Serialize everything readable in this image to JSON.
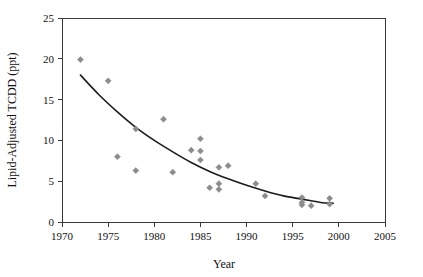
{
  "chart_data": {
    "type": "scatter",
    "title": "",
    "subtitle": "",
    "xlabel": "Year",
    "ylabel": "Lipid-Adjusted TCDD (ppt)",
    "xlim": [
      1970,
      2005
    ],
    "ylim": [
      0,
      25
    ],
    "xticks": [
      1970,
      1975,
      1980,
      1985,
      1990,
      1995,
      2000,
      2005
    ],
    "yticks": [
      0,
      5,
      10,
      15,
      20,
      25
    ],
    "xtick_labels": [
      "1970",
      "1975",
      "1980",
      "1985",
      "1990",
      "1995",
      "2000",
      "2005"
    ],
    "ytick_labels": [
      "0",
      "5",
      "10",
      "15",
      "20",
      "25"
    ],
    "grid": false,
    "legend": false,
    "legend_position": "none",
    "marker_shape": "diamond",
    "marker_color": "#8c8c8c",
    "curve_color": "#1c1c1c",
    "frame": "box",
    "points": [
      {
        "x": 1972.0,
        "y": 19.9
      },
      {
        "x": 1975.0,
        "y": 17.3
      },
      {
        "x": 1976.0,
        "y": 8.0
      },
      {
        "x": 1978.0,
        "y": 11.4
      },
      {
        "x": 1978.0,
        "y": 6.3
      },
      {
        "x": 1981.0,
        "y": 12.6
      },
      {
        "x": 1982.0,
        "y": 6.1
      },
      {
        "x": 1984.0,
        "y": 8.8
      },
      {
        "x": 1985.0,
        "y": 10.2
      },
      {
        "x": 1985.0,
        "y": 8.7
      },
      {
        "x": 1985.0,
        "y": 7.6
      },
      {
        "x": 1986.0,
        "y": 4.2
      },
      {
        "x": 1987.0,
        "y": 6.7
      },
      {
        "x": 1987.0,
        "y": 4.7
      },
      {
        "x": 1987.0,
        "y": 4.0
      },
      {
        "x": 1988.0,
        "y": 6.9
      },
      {
        "x": 1991.0,
        "y": 4.7
      },
      {
        "x": 1992.0,
        "y": 3.2
      },
      {
        "x": 1996.0,
        "y": 3.0
      },
      {
        "x": 1996.0,
        "y": 2.4
      },
      {
        "x": 1996.0,
        "y": 2.1
      },
      {
        "x": 1997.0,
        "y": 2.0
      },
      {
        "x": 1999.0,
        "y": 2.9
      },
      {
        "x": 1999.0,
        "y": 2.2
      }
    ],
    "fit_curve": {
      "description": "exponential decay trend line",
      "x_start": 1972.0,
      "x_end": 1999.4,
      "points": [
        {
          "x": 1972.0,
          "y": 18.0
        },
        {
          "x": 1974.0,
          "y": 15.6
        },
        {
          "x": 1976.0,
          "y": 13.5
        },
        {
          "x": 1978.0,
          "y": 11.6
        },
        {
          "x": 1980.0,
          "y": 10.0
        },
        {
          "x": 1982.0,
          "y": 8.6
        },
        {
          "x": 1984.0,
          "y": 7.3
        },
        {
          "x": 1986.0,
          "y": 6.2
        },
        {
          "x": 1988.0,
          "y": 5.3
        },
        {
          "x": 1990.0,
          "y": 4.5
        },
        {
          "x": 1992.0,
          "y": 3.8
        },
        {
          "x": 1994.0,
          "y": 3.2
        },
        {
          "x": 1996.0,
          "y": 2.8
        },
        {
          "x": 1998.0,
          "y": 2.4
        },
        {
          "x": 1999.4,
          "y": 2.3
        }
      ]
    }
  }
}
